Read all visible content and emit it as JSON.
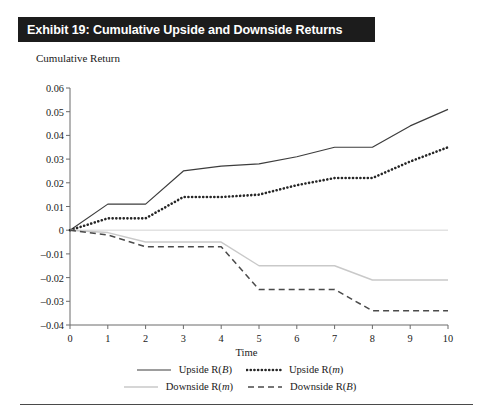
{
  "exhibit": {
    "title": "Exhibit 19: Cumulative Upside and Downside Returns"
  },
  "colors": {
    "title_bar_background": "#1c1c1c",
    "title_text": "#ffffff",
    "axis": "#6b6b6b",
    "upside_beta": "#3d3d3d",
    "upside_m": "#262626",
    "downside_m": "#c9c9c9",
    "downside_beta": "#4a4a4a",
    "zero_line": "#e2e2e2",
    "footer_rule": "#4a4a4a"
  },
  "legend": {
    "rows": [
      [
        {
          "label": "Upside R(B)",
          "name_prefix": "Upside R(",
          "italic": "B",
          "name_suffix": ")",
          "style": "solid",
          "color": "#3d3d3d"
        },
        {
          "label": "Upside R(m)",
          "name_prefix": "Upside R(",
          "italic": "m",
          "name_suffix": ")",
          "style": "dotted",
          "color": "#262626"
        }
      ],
      [
        {
          "label": "Downside R(m)",
          "name_prefix": "Downside R(",
          "italic": "m",
          "name_suffix": ")",
          "style": "solid-light",
          "color": "#c9c9c9"
        },
        {
          "label": "Downside R(B)",
          "name_prefix": "Downside R(",
          "italic": "B",
          "name_suffix": ")",
          "style": "dashed",
          "color": "#4a4a4a"
        }
      ]
    ]
  },
  "chart_data": {
    "type": "line",
    "title": "Exhibit 19: Cumulative Upside and Downside Returns",
    "subtitle": "",
    "xlabel": "Time",
    "ylabel": "Cumulative Return",
    "xlim": [
      0,
      10
    ],
    "ylim": [
      -0.04,
      0.06
    ],
    "grid": false,
    "legend_position": "bottom",
    "x": [
      0,
      1,
      2,
      3,
      4,
      5,
      6,
      7,
      8,
      9,
      10
    ],
    "xticks": [
      "0",
      "1",
      "2",
      "3",
      "4",
      "5",
      "6",
      "7",
      "8",
      "9",
      "10"
    ],
    "yticks": [
      "0.06",
      "0.05",
      "0.04",
      "0.03",
      "0.02",
      "0.01",
      "0",
      "-0.01",
      "-0.02",
      "-0.03",
      "-0.04"
    ],
    "ytick_values": [
      0.06,
      0.05,
      0.04,
      0.03,
      0.02,
      0.01,
      0,
      -0.01,
      -0.02,
      -0.03,
      -0.04
    ],
    "series": [
      {
        "name": "Upside R(B)",
        "style": "solid",
        "color": "#3d3d3d",
        "values": [
          0.0,
          0.011,
          0.011,
          0.025,
          0.027,
          0.028,
          0.031,
          0.035,
          0.035,
          0.044,
          0.051
        ]
      },
      {
        "name": "Upside R(m)",
        "style": "dotted",
        "color": "#262626",
        "values": [
          0.0,
          0.005,
          0.005,
          0.014,
          0.014,
          0.015,
          0.019,
          0.022,
          0.022,
          0.029,
          0.035
        ]
      },
      {
        "name": "Downside R(m)",
        "style": "solid-light",
        "color": "#c9c9c9",
        "values": [
          0.0,
          -0.001,
          -0.005,
          -0.005,
          -0.005,
          -0.015,
          -0.015,
          -0.015,
          -0.021,
          -0.021,
          -0.021
        ]
      },
      {
        "name": "Downside R(B)",
        "style": "dashed",
        "color": "#4a4a4a",
        "values": [
          0.0,
          -0.002,
          -0.007,
          -0.007,
          -0.007,
          -0.025,
          -0.025,
          -0.025,
          -0.034,
          -0.034,
          -0.034
        ]
      }
    ]
  }
}
